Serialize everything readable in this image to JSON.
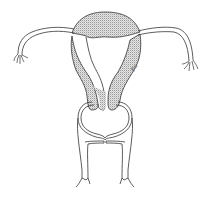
{
  "figure": {
    "parts": [
      {
        "id": "fundus",
        "label": "Uterine fundus"
      },
      {
        "id": "left-fallopian-tube",
        "label": "Left fallopian tube"
      },
      {
        "id": "right-fallopian-tube",
        "label": "Right fallopian tube"
      },
      {
        "id": "left-fimbriae",
        "label": "Left fimbriae"
      },
      {
        "id": "right-fimbriae",
        "label": "Right fimbriae"
      },
      {
        "id": "uterine-wall",
        "label": "Myometrium (stippled)"
      },
      {
        "id": "cervix",
        "label": "Cervix"
      },
      {
        "id": "vagina",
        "label": "Vagina"
      }
    ],
    "signature": "Pa",
    "colors": {
      "line": "#333333",
      "stipple": "#b8b8b8",
      "background": "#ffffff"
    }
  }
}
